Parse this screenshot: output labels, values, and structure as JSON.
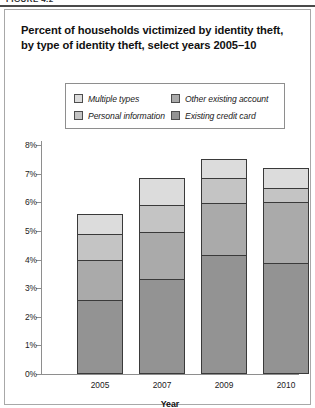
{
  "figure": {
    "top_fragment": "FIGURE 4.2",
    "title": "Percent of households victimized by identity theft, by type of identity theft, select years 2005–10"
  },
  "legend": {
    "items": [
      {
        "label": "Multiple types",
        "color": "#dcdcdc"
      },
      {
        "label": "Other existing account",
        "color": "#aaaaaa"
      },
      {
        "label": "Personal information",
        "color": "#c4c4c4"
      },
      {
        "label": "Existing credit card",
        "color": "#939393"
      }
    ]
  },
  "chart_data": {
    "type": "bar",
    "stacked": true,
    "title": "Percent of households victimized by identity theft, by type of identity theft, select years 2005–10",
    "xlabel": "Year",
    "ylabel": "",
    "categories": [
      "2005",
      "2007",
      "2009",
      "2010"
    ],
    "ylim": [
      0,
      8
    ],
    "ytick_labels": [
      "0%",
      "1%",
      "2%",
      "3%",
      "4%",
      "5%",
      "6%",
      "7%",
      "8%"
    ],
    "ytick_values": [
      0,
      1,
      2,
      3,
      4,
      5,
      6,
      7,
      8
    ],
    "grid": false,
    "legend_position": "above-plot",
    "series": [
      {
        "name": "Existing credit card",
        "color": "#939393",
        "values": [
          2.6,
          3.35,
          4.2,
          3.9
        ]
      },
      {
        "name": "Other existing account",
        "color": "#aaaaaa",
        "values": [
          1.4,
          1.65,
          1.8,
          2.15
        ]
      },
      {
        "name": "Personal information",
        "color": "#c4c4c4",
        "values": [
          0.9,
          0.9,
          0.85,
          0.45
        ]
      },
      {
        "name": "Multiple types",
        "color": "#dcdcdc",
        "values": [
          0.7,
          0.95,
          0.65,
          0.7
        ]
      }
    ],
    "totals": [
      5.6,
      6.85,
      7.5,
      7.2
    ]
  }
}
